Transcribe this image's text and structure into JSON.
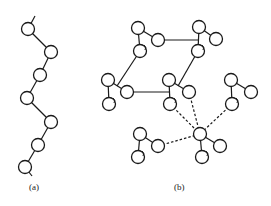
{
  "figure": {
    "panels": [
      {
        "id": "a",
        "label": "(a)",
        "description": "zigzag chain of atoms"
      },
      {
        "id": "b",
        "label": "(b)",
        "description": "network of triatomic units linked by solid and dashed bonds"
      }
    ],
    "colors": {
      "stroke": "#1a1a1a",
      "background": "#ffffff"
    },
    "panel_a": {
      "atoms": [
        [
          28,
          29
        ],
        [
          51,
          52
        ],
        [
          40,
          75
        ],
        [
          27,
          98
        ],
        [
          51,
          122
        ],
        [
          38,
          145
        ],
        [
          25,
          167
        ]
      ],
      "tails": [
        [
          [
            28,
            29
          ],
          [
            35,
            16
          ]
        ],
        [
          [
            25,
            167
          ],
          [
            32,
            176
          ]
        ]
      ]
    },
    "panel_b": {
      "groups": [
        {
          "top": [
            138,
            28
          ],
          "right": [
            158,
            40
          ],
          "bottom": [
            140,
            51
          ]
        },
        {
          "top": [
            199,
            27
          ],
          "right": [
            216,
            39
          ],
          "bottom": [
            198,
            51
          ]
        },
        {
          "top": [
            108,
            80
          ],
          "right": [
            127,
            92
          ],
          "bottom": [
            109,
            104
          ]
        },
        {
          "top": [
            169,
            80
          ],
          "right": [
            189,
            92
          ],
          "bottom": [
            170,
            104
          ]
        },
        {
          "top": [
            231,
            80
          ],
          "right": [
            251,
            92
          ],
          "bottom": [
            232,
            104
          ]
        },
        {
          "top": [
            140,
            134
          ],
          "right": [
            158,
            146
          ],
          "bottom": [
            138,
            157
          ]
        },
        {
          "top": [
            200,
            134
          ],
          "right": [
            220,
            146
          ],
          "bottom": [
            202,
            157
          ]
        }
      ],
      "solid_links": [
        [
          [
            158,
            40
          ],
          [
            199,
            40
          ]
        ],
        [
          [
            127,
            92
          ],
          [
            169,
            92
          ]
        ],
        [
          [
            140,
            51
          ],
          [
            117,
            86
          ]
        ],
        [
          [
            198,
            51
          ],
          [
            178,
            86
          ]
        ]
      ],
      "dashed_links": [
        [
          [
            189,
            92
          ],
          [
            200,
            134
          ]
        ],
        [
          [
            170,
            104
          ],
          [
            200,
            134
          ]
        ],
        [
          [
            232,
            104
          ],
          [
            200,
            134
          ]
        ],
        [
          [
            158,
            146
          ],
          [
            200,
            134
          ]
        ]
      ]
    }
  }
}
